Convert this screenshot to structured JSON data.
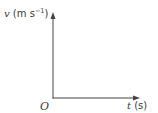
{
  "diagram": {
    "type": "velocity-time axes",
    "y_axis": {
      "variable": "v",
      "unit_open": " (m s",
      "unit_sup": "−1",
      "unit_close": ")"
    },
    "x_axis": {
      "variable": "t",
      "unit": " (s)"
    },
    "origin": "O",
    "colors": {
      "axis": "#444444",
      "text": "#3a3a3a",
      "background": "#ffffff"
    }
  }
}
